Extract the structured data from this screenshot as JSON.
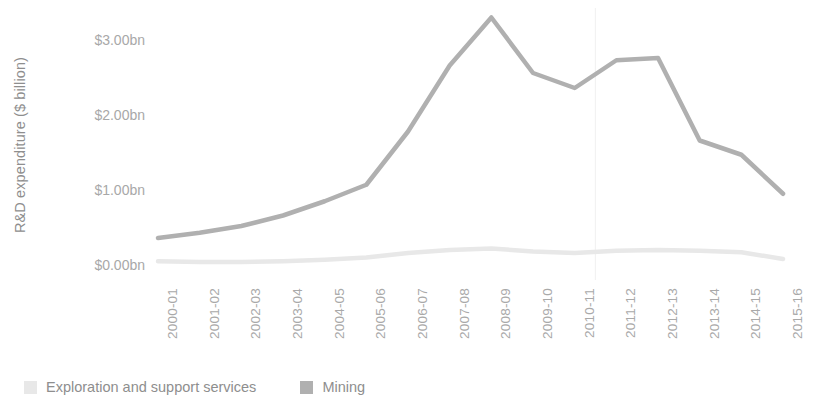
{
  "chart_data": {
    "type": "line",
    "title": "",
    "xlabel": "",
    "ylabel": "R&D expenditure ($ billion)",
    "ylim": [
      0,
      3.5
    ],
    "ytick_labels": [
      "$0.00bn",
      "$1.00bn",
      "$2.00bn",
      "$3.00bn"
    ],
    "ytick_values": [
      0,
      1,
      2,
      3
    ],
    "grid": false,
    "legend_position": "bottom-left",
    "categories": [
      "2000-01",
      "2001-02",
      "2002-03",
      "2003-04",
      "2004-05",
      "2005-06",
      "2006-07",
      "2007-08",
      "2008-09",
      "2009-10",
      "2010-11",
      "2011-12",
      "2012-13",
      "2013-14",
      "2014-15",
      "2015-16"
    ],
    "series": [
      {
        "name": "Exploration and support services",
        "color": "#e8e8e8",
        "values": [
          0.05,
          0.04,
          0.04,
          0.05,
          0.07,
          0.1,
          0.16,
          0.2,
          0.22,
          0.18,
          0.16,
          0.19,
          0.2,
          0.19,
          0.17,
          0.08
        ]
      },
      {
        "name": "Mining",
        "color": "#b0b0b0",
        "values": [
          0.36,
          0.43,
          0.52,
          0.66,
          0.85,
          1.07,
          1.78,
          2.66,
          3.3,
          2.56,
          2.36,
          2.73,
          2.76,
          1.66,
          1.47,
          0.95
        ]
      }
    ]
  },
  "legend": {
    "items": [
      {
        "label": "Exploration and support services",
        "color": "#e8e8e8"
      },
      {
        "label": "Mining",
        "color": "#b0b0b0"
      }
    ]
  },
  "axes": {
    "y_title": "R&D expenditure ($ billion)"
  }
}
